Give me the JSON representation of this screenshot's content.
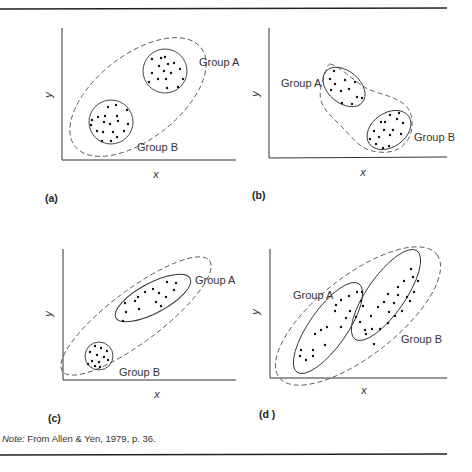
{
  "figure": {
    "note_prefix": "Note:",
    "note_text": " From Allen & Yen, 1979, p. 36.",
    "panels": [
      {
        "id": "a",
        "label": "(a)",
        "x_axis": "x",
        "y_axis": "y",
        "group_a": "Group A",
        "group_b": "Group B",
        "description": "Two distinct circular clusters; overall dashed ellipse shows positive correlation"
      },
      {
        "id": "b",
        "label": "(b)",
        "x_axis": "x",
        "y_axis": "y",
        "group_a": "Group A",
        "group_b": "Group B",
        "description": "Two clusters each with positive within-group correlation; overall negative trend"
      },
      {
        "id": "c",
        "label": "(c)",
        "x_axis": "x",
        "y_axis": "y",
        "group_a": "Group A",
        "group_b": "Group B",
        "description": "Group A elongated ellipse, Group B small circle; overall positive correlation"
      },
      {
        "id": "d",
        "label": "(d )",
        "x_axis": "x",
        "y_axis": "y",
        "group_a": "Group A",
        "group_b": "Group B",
        "description": "Two parallel elongated ellipses; overall positive correlation"
      }
    ]
  }
}
